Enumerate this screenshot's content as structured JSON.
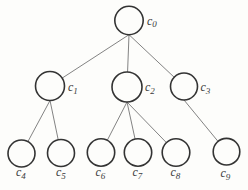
{
  "diagram": {
    "type": "tree",
    "canvas": {
      "width": 248,
      "height": 190,
      "background": "#fdfdfb"
    },
    "style": {
      "node_fill": "#fdfdfb",
      "node_stroke": "#333333",
      "node_stroke_width": 1.6,
      "edge_stroke": "#838383",
      "edge_stroke_width": 1,
      "label_color": "#3a3a3a",
      "label_font_size": 12,
      "subscript_font_size": 9,
      "subscript_dy": 2.5
    },
    "nodes": [
      {
        "id": "c0",
        "label_base": "c",
        "label_sub": "0",
        "x": 129,
        "y": 20.5,
        "r": 14.2,
        "label_x": 147,
        "label_y": 24.5
      },
      {
        "id": "c1",
        "label_base": "c",
        "label_sub": "1",
        "x": 50,
        "y": 86,
        "r": 14.5,
        "label_x": 68,
        "label_y": 91
      },
      {
        "id": "c2",
        "label_base": "c",
        "label_sub": "2",
        "x": 127,
        "y": 87,
        "r": 15,
        "label_x": 145,
        "label_y": 91
      },
      {
        "id": "c3",
        "label_base": "c",
        "label_sub": "3",
        "x": 184,
        "y": 86.5,
        "r": 13.5,
        "label_x": 200.5,
        "label_y": 91
      },
      {
        "id": "c4",
        "label_base": "c",
        "label_sub": "4",
        "x": 21.5,
        "y": 153.5,
        "r": 13.5,
        "label_x": 16,
        "label_y": 176
      },
      {
        "id": "c5",
        "label_base": "c",
        "label_sub": "5",
        "x": 61,
        "y": 153,
        "r": 13.5,
        "label_x": 56,
        "label_y": 176
      },
      {
        "id": "c6",
        "label_base": "c",
        "label_sub": "6",
        "x": 101,
        "y": 152.5,
        "r": 13.7,
        "label_x": 95.5,
        "label_y": 176
      },
      {
        "id": "c7",
        "label_base": "c",
        "label_sub": "7",
        "x": 138,
        "y": 152.5,
        "r": 13.7,
        "label_x": 132.5,
        "label_y": 176
      },
      {
        "id": "c8",
        "label_base": "c",
        "label_sub": "8",
        "x": 176,
        "y": 152.5,
        "r": 13.8,
        "label_x": 170.5,
        "label_y": 176
      },
      {
        "id": "c9",
        "label_base": "c",
        "label_sub": "9",
        "x": 226.5,
        "y": 151.7,
        "r": 13.3,
        "label_x": 220.5,
        "label_y": 177
      }
    ],
    "edges": [
      {
        "from": "c0",
        "to": "c1"
      },
      {
        "from": "c0",
        "to": "c2"
      },
      {
        "from": "c0",
        "to": "c3"
      },
      {
        "from": "c1",
        "to": "c4"
      },
      {
        "from": "c1",
        "to": "c5"
      },
      {
        "from": "c2",
        "to": "c6"
      },
      {
        "from": "c2",
        "to": "c7"
      },
      {
        "from": "c2",
        "to": "c8"
      },
      {
        "from": "c3",
        "to": "c9"
      }
    ]
  }
}
